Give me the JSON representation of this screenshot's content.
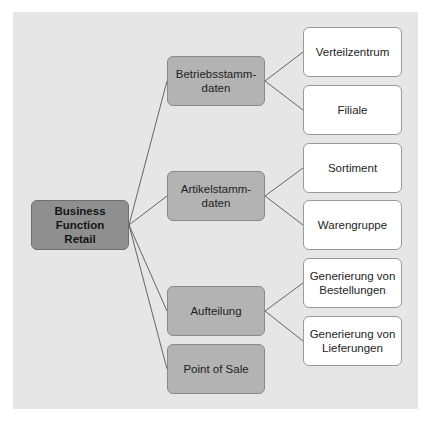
{
  "diagram": {
    "type": "tree",
    "colors": {
      "panel_bg": "#e6e6e6",
      "root_fill": "#8f8f8f",
      "mid_fill": "#b3b3b3",
      "leaf_fill": "#ffffff",
      "line": "#555555"
    },
    "root": {
      "label": "Business Function Retail",
      "line1": "Business Function",
      "line2": "Retail"
    },
    "branches": [
      {
        "label": "Betriebsstammdaten",
        "line1": "Betriebsstamm-",
        "line2": "daten",
        "children": [
          {
            "label": "Verteilzentrum"
          },
          {
            "label": "Filiale"
          }
        ]
      },
      {
        "label": "Artikelstammdaten",
        "line1": "Artikelstamm-",
        "line2": "daten",
        "children": [
          {
            "label": "Sortiment"
          },
          {
            "label": "Warengruppe"
          }
        ]
      },
      {
        "label": "Aufteilung",
        "children": [
          {
            "label": "Generierung von Bestellungen",
            "line1": "Generierung von",
            "line2": "Bestellungen"
          },
          {
            "label": "Generierung von Lieferungen",
            "line1": "Generierung von",
            "line2": "Lieferungen"
          }
        ]
      },
      {
        "label": "Point of Sale",
        "children": []
      }
    ]
  }
}
